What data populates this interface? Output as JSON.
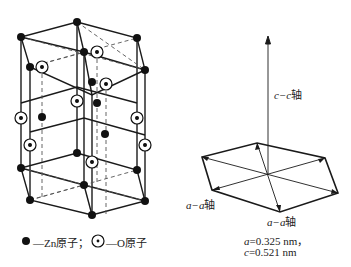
{
  "legend": {
    "zn_label": "—Zn原子；",
    "o_label": "—O原子"
  },
  "axes": {
    "c_axis_label_var": "c−c",
    "c_axis_label_suffix": "轴",
    "a_axis_left_var": "a−a",
    "a_axis_left_suffix": "轴",
    "a_axis_bottom_var": "a−a",
    "a_axis_bottom_suffix": "轴"
  },
  "params": {
    "a_var": "a",
    "a_value": "=0.325 nm，",
    "c_var": "c",
    "c_value": "=0.521 nm"
  },
  "colors": {
    "line": "#1a1a1a",
    "dash": "#555555",
    "background": "#ffffff"
  }
}
